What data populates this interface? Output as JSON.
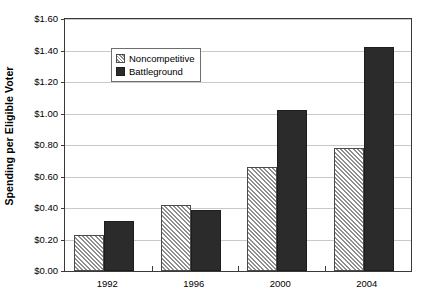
{
  "chart_data": {
    "type": "bar",
    "title": "",
    "xlabel": "",
    "ylabel": "Spending per Eligible Voter",
    "categories": [
      "1992",
      "1996",
      "2000",
      "2004"
    ],
    "series": [
      {
        "name": "Noncompetitive",
        "values": [
          0.23,
          0.42,
          0.66,
          0.78
        ],
        "pattern": "diagonal-hatch",
        "color": "#ffffff"
      },
      {
        "name": "Battleground",
        "values": [
          0.32,
          0.385,
          1.02,
          1.42
        ],
        "pattern": "solid",
        "color": "#2b2b2b"
      }
    ],
    "ylim": [
      0.0,
      1.6
    ],
    "ytick_step": 0.2,
    "ytick_labels": [
      "$0.00",
      "$0.20",
      "$0.40",
      "$0.60",
      "$0.80",
      "$1.00",
      "$1.20",
      "$1.40",
      "$1.60"
    ],
    "ytick_values": [
      0.0,
      0.2,
      0.4,
      0.6,
      0.8,
      1.0,
      1.2,
      1.4,
      1.6
    ],
    "grid": true,
    "grid_axis": "y",
    "legend_position": "upper-left-inside",
    "legend_entries": [
      "Noncompetitive",
      "Battleground"
    ]
  },
  "colors": {
    "grid": "#c9c9c9",
    "axis": "#3a3a3a",
    "battleground": "#2b2b2b",
    "noncompetitive_hatch": "#8e8e8e",
    "background": "#ffffff"
  }
}
